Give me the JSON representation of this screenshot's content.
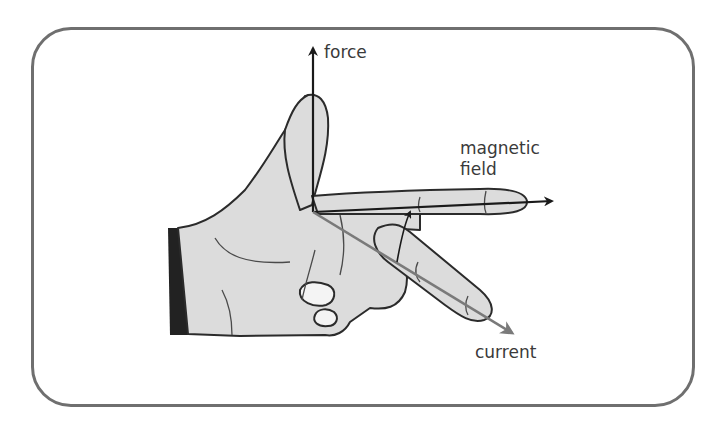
{
  "diagram": {
    "labels": {
      "force": "force",
      "magnetic_field_line1": "magnetic",
      "magnetic_field_line2": "field",
      "current": "current"
    },
    "arrows": [
      {
        "name": "force",
        "direction": "up",
        "color": "#1a1a1a"
      },
      {
        "name": "magnetic field",
        "direction": "right",
        "color": "#1a1a1a"
      },
      {
        "name": "current",
        "direction": "down-right",
        "color": "#7a7a7a"
      }
    ],
    "colors": {
      "frame": "#6f6f6f",
      "hand_fill": "#dcdcdc",
      "hand_outline": "#2b2b2b",
      "sleeve": "#222222"
    }
  }
}
